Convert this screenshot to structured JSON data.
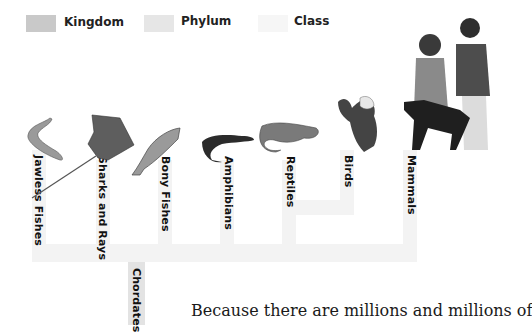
{
  "legend": {
    "items": [
      {
        "label": "Kingdom",
        "color": "#c9c9c9"
      },
      {
        "label": "Phylum",
        "color": "#e6e6e6"
      },
      {
        "label": "Class",
        "color": "#f5f5f5"
      }
    ]
  },
  "tree": {
    "phylum_label": "Chordates",
    "classes": [
      {
        "label": "Jawless Fishes",
        "icon": "lamprey-illustration"
      },
      {
        "label": "Sharks and Rays",
        "icon": "stingray-illustration"
      },
      {
        "label": "Bony Fishes",
        "icon": "trout-illustration"
      },
      {
        "label": "Amphibians",
        "icon": "salamander-illustration"
      },
      {
        "label": "Reptiles",
        "icon": "lizard-illustration"
      },
      {
        "label": "Birds",
        "icon": "eagle-illustration"
      },
      {
        "label": "Mammals",
        "icon": "people-and-dog-illustration"
      }
    ]
  },
  "body": {
    "text": "Because there are millions and millions of"
  }
}
